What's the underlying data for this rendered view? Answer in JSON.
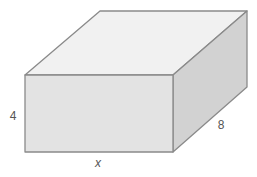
{
  "diagram": {
    "type": "rectangular-prism",
    "labels": {
      "height": "4",
      "depth": "8",
      "width": "x"
    },
    "colors": {
      "top_face": "#f1f1f1",
      "front_face": "#e3e3e3",
      "side_face": "#d2d2d2",
      "edge": "#8a8a8a",
      "label": "#555555"
    }
  }
}
